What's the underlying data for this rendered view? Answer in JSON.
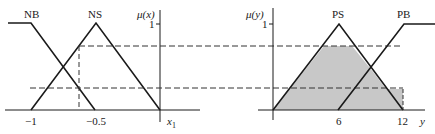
{
  "left_panel": {
    "axis_label": "μ(x)",
    "one_tick": "1",
    "x_axis_label": "x",
    "x_axis_subscript": "1",
    "sets": [
      {
        "name": "NB",
        "shape": "left-shoulder"
      },
      {
        "name": "NS",
        "shape": "triangle"
      }
    ],
    "ticks": [
      "−1",
      "−0.5"
    ]
  },
  "right_panel": {
    "axis_label": "μ(y)",
    "one_tick": "1",
    "y_axis_label": "y",
    "sets": [
      {
        "name": "PS",
        "shape": "triangle"
      },
      {
        "name": "PB",
        "shape": "right-shoulder"
      }
    ],
    "ticks": [
      "6",
      "12"
    ]
  },
  "colors": {
    "line": "#1a1a1a",
    "shade": "#c8c8c8",
    "dash": "#333333"
  }
}
